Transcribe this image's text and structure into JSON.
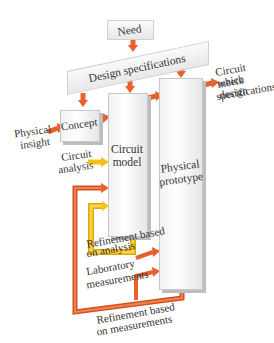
{
  "diagram": {
    "nodes": {
      "need": "Need",
      "design_specs": "Design specifications",
      "concept": "Concept",
      "circuit_model_1": "Circuit",
      "circuit_model_2": "model",
      "physical_prototype_1": "Physical",
      "physical_prototype_2": "prototype"
    },
    "labels": {
      "physical_insight_1": "Physical",
      "physical_insight_2": "insight",
      "circuit_analysis_1": "Circuit",
      "circuit_analysis_2": "analysis",
      "refinement_analysis_1": "Refinement based",
      "refinement_analysis_2": "on analysis",
      "lab_measurements_1": "Laboratory",
      "lab_measurements_2": "measurements",
      "refinement_measurements_1": "Refinement based",
      "refinement_measurements_2": "on measurements",
      "output_1": "Circuit which",
      "output_2": "meets design",
      "output_3": "specifications"
    },
    "colors": {
      "arrow_orange": "#e8602c",
      "arrow_yellow": "#f2c21b"
    }
  }
}
